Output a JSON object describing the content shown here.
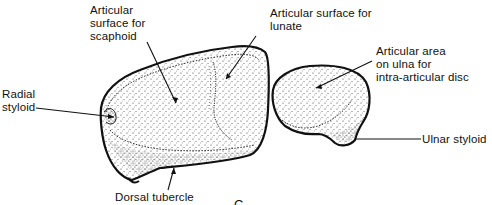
{
  "figure": {
    "letter": "C",
    "colors": {
      "ink": "#111111",
      "stipple": "#333333",
      "background": "#ffffff"
    },
    "structures": [
      {
        "id": "radius",
        "name": "Distal radius (articular surface)"
      },
      {
        "id": "ulna",
        "name": "Distal ulna (head)"
      }
    ],
    "labels": [
      {
        "id": "scaphoid",
        "lines": [
          "Articular",
          "surface for",
          "scaphoid"
        ]
      },
      {
        "id": "lunate",
        "lines": [
          "Articular surface for",
          "lunate"
        ]
      },
      {
        "id": "ulna-disc",
        "lines": [
          "Articular area",
          "on ulna for",
          "intra-articular disc"
        ]
      },
      {
        "id": "radial-styloid",
        "lines": [
          "Radial",
          "styloid"
        ]
      },
      {
        "id": "ulnar-styloid",
        "lines": [
          "Ulnar styloid"
        ]
      },
      {
        "id": "dorsal-tubercle",
        "lines": [
          "Dorsal tubercle"
        ]
      }
    ]
  }
}
